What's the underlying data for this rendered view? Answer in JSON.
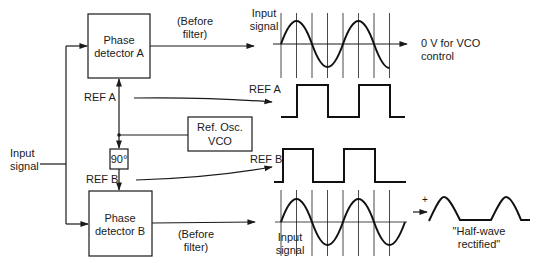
{
  "blocks": {
    "phase_detector_a": {
      "line1": "Phase",
      "line2": "detector A"
    },
    "phase_detector_b": {
      "line1": "Phase",
      "line2": "detector B"
    },
    "ref_osc": {
      "line1": "Ref. Osc.",
      "line2": "VCO"
    },
    "phase_shift": {
      "label": "90°"
    }
  },
  "labels": {
    "input_signal_left": {
      "line1": "Input",
      "line2": "signal"
    },
    "ref_a": "REF A",
    "ref_b": "REF B",
    "before_filter_top": {
      "line1": "(Before",
      "line2": "filter)"
    },
    "before_filter_bottom": {
      "line1": "(Before",
      "line2": "filter)"
    },
    "ref_a_wave": "REF A",
    "ref_b_wave": "REF B",
    "input_signal_top": {
      "line1": "Input",
      "line2": "signal"
    },
    "input_signal_bottom": {
      "line1": "Input",
      "line2": "signal"
    },
    "vco_control": {
      "line1": "0 V for VCO",
      "line2": "control"
    },
    "half_wave": {
      "line1": "\"Half-wave",
      "line2": "rectified\""
    },
    "plus_sign": "+"
  },
  "colors": {
    "ink": "#1a1a1a",
    "background": "#ffffff"
  }
}
